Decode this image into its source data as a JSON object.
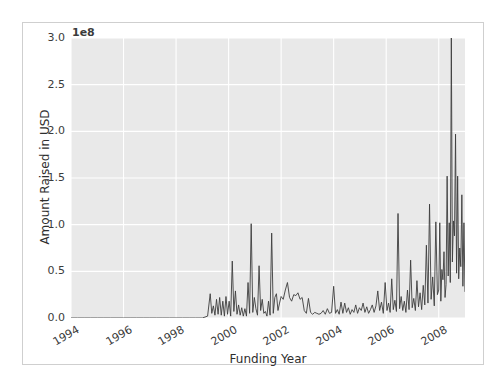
{
  "figure": {
    "background_color": "#ffffff",
    "plot_background_color": "#e9e9e9",
    "grid_color": "#ffffff",
    "line_color": "#3d3d3d",
    "border_color": "#cfcfcf"
  },
  "chart_data": {
    "type": "line",
    "title": "",
    "xlabel": "Funding Year",
    "ylabel": "Amount Raised in USD",
    "y_offset_text": "1e8",
    "y_offset_multiplier": 100000000,
    "xlim": [
      1994.0,
      2009.0
    ],
    "ylim": [
      0.0,
      3.0
    ],
    "xticks": [
      1994,
      1996,
      1998,
      2000,
      2002,
      2004,
      2006,
      2008
    ],
    "xticklabels": [
      "1994",
      "1996",
      "1998",
      "2000",
      "2002",
      "2004",
      "2006",
      "2008"
    ],
    "yticks": [
      0.0,
      0.5,
      1.0,
      1.5,
      2.0,
      2.5,
      3.0
    ],
    "yticklabels": [
      "0.0",
      "0.5",
      "1.0",
      "1.5",
      "2.0",
      "2.5",
      "3.0"
    ],
    "grid": true,
    "legend": false,
    "x": [
      1994.0,
      1994.25,
      1994.5,
      1994.75,
      1995.0,
      1995.25,
      1995.5,
      1995.75,
      1996.0,
      1996.25,
      1996.5,
      1996.75,
      1997.0,
      1997.25,
      1997.5,
      1997.75,
      1998.0,
      1998.25,
      1998.5,
      1998.75,
      1999.0,
      1999.1,
      1999.2,
      1999.3,
      1999.36,
      1999.42,
      1999.48,
      1999.54,
      1999.6,
      1999.66,
      1999.72,
      1999.78,
      1999.84,
      1999.9,
      1999.96,
      2000.02,
      2000.08,
      2000.14,
      2000.2,
      2000.26,
      2000.32,
      2000.38,
      2000.44,
      2000.5,
      2000.56,
      2000.62,
      2000.68,
      2000.74,
      2000.8,
      2000.86,
      2000.92,
      2000.98,
      2001.04,
      2001.1,
      2001.16,
      2001.22,
      2001.28,
      2001.34,
      2001.4,
      2001.46,
      2001.52,
      2001.58,
      2001.64,
      2001.7,
      2001.76,
      2001.82,
      2001.88,
      2001.94,
      2002.0,
      2002.08,
      2002.16,
      2002.24,
      2002.32,
      2002.4,
      2002.48,
      2002.56,
      2002.64,
      2002.72,
      2002.8,
      2002.88,
      2002.96,
      2003.04,
      2003.12,
      2003.2,
      2003.28,
      2003.36,
      2003.44,
      2003.52,
      2003.6,
      2003.68,
      2003.76,
      2003.84,
      2003.92,
      2004.0,
      2004.07,
      2004.14,
      2004.21,
      2004.28,
      2004.35,
      2004.42,
      2004.49,
      2004.56,
      2004.63,
      2004.7,
      2004.77,
      2004.84,
      2004.91,
      2004.98,
      2005.05,
      2005.12,
      2005.19,
      2005.26,
      2005.33,
      2005.4,
      2005.47,
      2005.54,
      2005.61,
      2005.68,
      2005.75,
      2005.82,
      2005.89,
      2005.96,
      2006.03,
      2006.09,
      2006.15,
      2006.21,
      2006.27,
      2006.33,
      2006.39,
      2006.45,
      2006.51,
      2006.57,
      2006.63,
      2006.69,
      2006.75,
      2006.81,
      2006.87,
      2006.93,
      2006.99,
      2007.05,
      2007.11,
      2007.17,
      2007.23,
      2007.29,
      2007.35,
      2007.41,
      2007.47,
      2007.53,
      2007.59,
      2007.65,
      2007.71,
      2007.77,
      2007.83,
      2007.89,
      2007.95,
      2008.0,
      2008.04,
      2008.08,
      2008.12,
      2008.16,
      2008.2,
      2008.24,
      2008.28,
      2008.32,
      2008.36,
      2008.4,
      2008.44,
      2008.48,
      2008.52,
      2008.56,
      2008.6,
      2008.64,
      2008.68,
      2008.72,
      2008.76,
      2008.8,
      2008.84,
      2008.88,
      2008.92,
      2008.96,
      2009.0
    ],
    "y": [
      0.0,
      0.0,
      0.0,
      0.0,
      0.0,
      0.0,
      0.0,
      0.0,
      0.0,
      0.0,
      0.0,
      0.0,
      0.0,
      0.0,
      0.0,
      0.0,
      0.0,
      0.0,
      0.0,
      0.0,
      0.0,
      0.01,
      0.02,
      0.26,
      0.05,
      0.13,
      0.03,
      0.2,
      0.04,
      0.22,
      0.03,
      0.18,
      0.02,
      0.23,
      0.04,
      0.18,
      0.02,
      0.61,
      0.07,
      0.29,
      0.04,
      0.14,
      0.03,
      0.11,
      0.02,
      0.1,
      0.02,
      0.38,
      0.05,
      1.01,
      0.06,
      0.22,
      0.1,
      0.03,
      0.56,
      0.08,
      0.2,
      0.05,
      0.07,
      0.02,
      0.18,
      0.03,
      0.91,
      0.05,
      0.22,
      0.26,
      0.08,
      0.16,
      0.23,
      0.2,
      0.3,
      0.38,
      0.22,
      0.18,
      0.25,
      0.24,
      0.27,
      0.2,
      0.22,
      0.08,
      0.05,
      0.21,
      0.06,
      0.04,
      0.06,
      0.05,
      0.04,
      0.05,
      0.08,
      0.04,
      0.1,
      0.05,
      0.06,
      0.34,
      0.05,
      0.09,
      0.04,
      0.17,
      0.05,
      0.16,
      0.06,
      0.11,
      0.04,
      0.09,
      0.06,
      0.14,
      0.05,
      0.11,
      0.08,
      0.16,
      0.06,
      0.12,
      0.05,
      0.09,
      0.14,
      0.06,
      0.13,
      0.29,
      0.08,
      0.17,
      0.05,
      0.38,
      0.08,
      0.16,
      0.06,
      0.42,
      0.09,
      0.19,
      0.07,
      1.12,
      0.1,
      0.23,
      0.08,
      0.18,
      0.06,
      0.3,
      0.09,
      0.62,
      0.11,
      0.21,
      0.08,
      0.4,
      0.12,
      0.27,
      0.09,
      0.35,
      0.14,
      0.78,
      0.16,
      1.22,
      0.2,
      0.44,
      0.13,
      1.03,
      0.25,
      0.3,
      1.02,
      0.18,
      0.52,
      0.41,
      0.71,
      0.22,
      0.36,
      1.52,
      0.45,
      1.02,
      0.38,
      3.0,
      0.6,
      1.04,
      0.88,
      1.97,
      0.48,
      1.52,
      0.42,
      0.75,
      0.55,
      1.32,
      0.34,
      1.02,
      0.28,
      0.62,
      0.4,
      0.78,
      0.3,
      0.55,
      0.26,
      0.38,
      0.3
    ]
  }
}
